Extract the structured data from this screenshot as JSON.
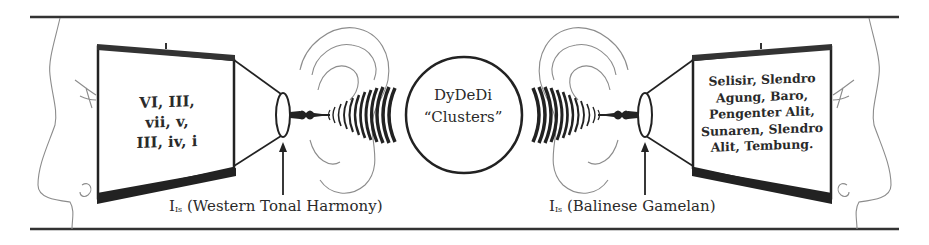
{
  "diagram": {
    "left_screen": {
      "lines": "VI, III,\nvii, v,\nIII, iv, i"
    },
    "right_screen": {
      "lines": "Selisir, Slendro\nAgung, Baro,\nPengenter Alit,\nSunaren, Slendro\nAlit, Tembung."
    },
    "center": {
      "label": "DyDeDi\n“Clusters”"
    },
    "captions": {
      "left": {
        "symbol": "I",
        "subscript": "Is",
        "text": " (Western Tonal Harmony)"
      },
      "right": {
        "symbol": "I",
        "subscript": "Is",
        "text": " (Balinese Gamelan)"
      }
    },
    "colors": {
      "line": "#222222",
      "outline": "#9a9a9a",
      "background": "#ffffff"
    }
  }
}
